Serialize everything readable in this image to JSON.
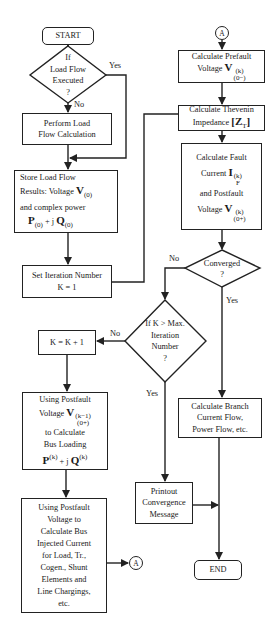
{
  "flowchart": {
    "start": "START",
    "end": "END",
    "connector_label": "A",
    "decision_load_flow": {
      "lines": [
        "If",
        "Load Flow",
        "Executed",
        "?"
      ],
      "yes": "Yes",
      "no": "No"
    },
    "perform_load_flow": [
      "Perform Load",
      "Flow Calculation"
    ],
    "store_results": {
      "line1": "Store Load Flow",
      "line2_text": "Results: Voltage",
      "line2_math": "V",
      "line2_sub": "(0)",
      "line3": "and complex power",
      "line4_P": "P",
      "line4_P_sub": "(0)",
      "line4_mid": " + j ",
      "line4_Q": "Q",
      "line4_Q_sub": "(0)"
    },
    "set_iteration": [
      "Set Iteration Number",
      "K = 1"
    ],
    "increment": "K = K + 1",
    "decision_max_iter": {
      "lines": [
        "If K > Max.",
        "Iteration",
        "Number",
        "?"
      ],
      "yes": "Yes",
      "no": "No"
    },
    "bus_loading": {
      "line1": "Using Postfault",
      "line2_text": "Voltage",
      "line2_math": "V",
      "line2_sup": "(k−1)",
      "line2_sub": "(0+)",
      "line3": "to Calculate",
      "line4": "Bus Loading",
      "line5_P": "P",
      "line5_P_sup": "(k)",
      "line5_mid": " + j ",
      "line5_Q": "Q",
      "line5_Q_sup": "(k)"
    },
    "injected_current": [
      "Using Postfault",
      "Voltage to",
      "Calculate Bus",
      "Injected Current",
      "for Load, Tr.,",
      "Cogen., Shunt",
      "Elements and",
      "Line Chargings,",
      "etc."
    ],
    "prefault": {
      "line1": "Calculate Prefault",
      "line2_text": "Voltage",
      "math": "V",
      "sup": "(k)",
      "sub": "(0−)"
    },
    "thevenin": {
      "line1": "Calculate Thevenin",
      "line2_text": "Impedance",
      "math": "[Z",
      "sub": "T",
      "close": "]"
    },
    "fault": {
      "line1": "Calculate Fault",
      "line2_text": "Current",
      "line2_math": "I",
      "line2_sup": "(k)",
      "line2_sub": "F",
      "line3": "and Postfault",
      "line4_text": "Voltage",
      "line4_math": "V",
      "line4_sup": "(k)",
      "line4_sub": "(0+)"
    },
    "decision_converged": {
      "lines": [
        "Converged",
        "?"
      ],
      "yes": "Yes",
      "no": "No"
    },
    "branch_flow": [
      "Calculate Branch",
      "Current Flow,",
      "Power Flow, etc."
    ],
    "printout": [
      "Printout",
      "Convergence",
      "Message"
    ]
  },
  "colors": {
    "line": "#222222",
    "background": "#ffffff",
    "text": "#1a1a1a"
  }
}
